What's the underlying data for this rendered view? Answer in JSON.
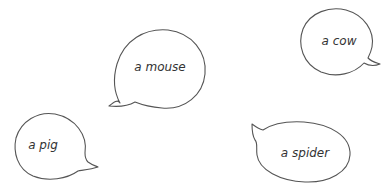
{
  "bubbles": [
    {
      "id": "mouse",
      "text": "a mouse",
      "cx": 160,
      "cy": 67
    },
    {
      "id": "cow",
      "text": "a cow",
      "cx": 339,
      "cy": 41
    },
    {
      "id": "pig",
      "text": "a pig",
      "cx": 43,
      "cy": 145
    },
    {
      "id": "spider",
      "text": "a spider",
      "cx": 305,
      "cy": 153
    }
  ],
  "colors": {
    "stroke": "#555555",
    "text": "#333333",
    "background": "#ffffff"
  }
}
